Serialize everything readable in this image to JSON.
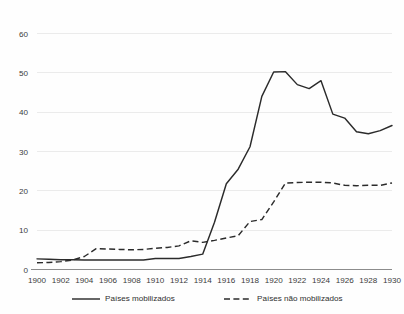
{
  "chart_data": {
    "type": "line",
    "title": "",
    "subtitle": "",
    "xlabel": "",
    "ylabel": "",
    "xlim": [
      1900,
      1930
    ],
    "ylim": [
      0,
      60
    ],
    "grid": true,
    "grid_axis": "y",
    "legend_position": "bottom",
    "x_tick_labels": [
      "1900",
      "1902",
      "1904",
      "1906",
      "1908",
      "1910",
      "1912",
      "1914",
      "1916",
      "1918",
      "1920",
      "1922",
      "1924",
      "1926",
      "1928",
      "1930"
    ],
    "x_tick_values": [
      1900,
      1902,
      1904,
      1906,
      1908,
      1910,
      1912,
      1914,
      1916,
      1918,
      1920,
      1922,
      1924,
      1926,
      1928,
      1930
    ],
    "y_tick_labels": [
      "0",
      "10",
      "20",
      "30",
      "40",
      "50",
      "60"
    ],
    "y_tick_values": [
      0,
      10,
      20,
      30,
      40,
      50,
      60
    ],
    "x": [
      1900,
      1901,
      1902,
      1903,
      1904,
      1905,
      1906,
      1907,
      1908,
      1909,
      1910,
      1911,
      1912,
      1913,
      1914,
      1915,
      1916,
      1917,
      1918,
      1919,
      1920,
      1921,
      1922,
      1923,
      1924,
      1925,
      1926,
      1927,
      1928,
      1929,
      1930
    ],
    "series": [
      {
        "name": "Países mobilizados",
        "style": "solid",
        "color": "#2b2b2b",
        "values": [
          2.7,
          2.6,
          2.5,
          2.5,
          2.4,
          2.4,
          2.4,
          2.4,
          2.4,
          2.4,
          2.8,
          2.8,
          2.8,
          3.3,
          3.9,
          12.0,
          21.8,
          25.5,
          31.2,
          44.0,
          50.2,
          50.3,
          47.0,
          46.0,
          48.0,
          39.5,
          38.5,
          35.0,
          34.5,
          35.3,
          36.6
        ]
      },
      {
        "name": "Países não mobilizados",
        "style": "dashed",
        "color": "#2b2b2b",
        "values": [
          1.7,
          1.8,
          2.0,
          2.4,
          3.3,
          5.3,
          5.2,
          5.1,
          5.0,
          5.1,
          5.4,
          5.6,
          6.0,
          7.3,
          6.9,
          7.4,
          8.0,
          8.6,
          12.2,
          12.7,
          17.2,
          22.0,
          22.1,
          22.2,
          22.2,
          22.0,
          21.4,
          21.3,
          21.4,
          21.4,
          22.0
        ]
      }
    ]
  },
  "legend": {
    "items": [
      {
        "label": "Países mobilizados",
        "style": "solid"
      },
      {
        "label": "Países não mobilizados",
        "style": "dashed"
      }
    ]
  }
}
